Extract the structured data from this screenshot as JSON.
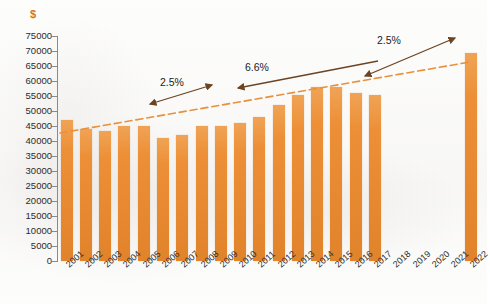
{
  "chart_data": {
    "type": "bar",
    "title": "",
    "subtitle": "",
    "xlabel": "",
    "ylabel": "$",
    "ylim": [
      0,
      75000
    ],
    "ytick_step": 5000,
    "grid": false,
    "legend": "none",
    "categories": [
      "2001",
      "2002",
      "2003",
      "2004",
      "2005",
      "2006",
      "2007",
      "2008",
      "2009",
      "2010",
      "2011",
      "2012",
      "2013",
      "2014",
      "2015",
      "2016",
      "2017",
      "2018",
      "2019",
      "2020",
      "2021",
      "2022"
    ],
    "values": [
      47000,
      44000,
      43500,
      45000,
      45000,
      41000,
      42000,
      45000,
      45000,
      46000,
      48000,
      52000,
      55500,
      58000,
      58000,
      56000,
      55500,
      null,
      null,
      null,
      null,
      69500
    ],
    "ytick_labels": [
      "75000",
      "70000",
      "65000",
      "60000",
      "55000",
      "50000",
      "45000",
      "40000",
      "35000",
      "30000",
      "25000",
      "20000",
      "15000",
      "10000",
      "5000",
      "0"
    ],
    "annotations": [
      {
        "text": "2.5%",
        "note": "growth rate annotation over 2001-2007 segment"
      },
      {
        "text": "6.6%",
        "note": "growth rate annotation over 2008-2017 segment"
      },
      {
        "text": "2.5%",
        "note": "growth rate annotation over 2017-2022 segment"
      }
    ],
    "trendline": {
      "style": "dashed",
      "color": "#e8903c",
      "from_year": "2001",
      "to_year": "2022"
    },
    "series_color": "#e8903c"
  },
  "axis": {
    "y_title": "$"
  },
  "annotations": {
    "first_rate": "2.5%",
    "second_rate": "6.6%",
    "third_rate": "2.5%"
  },
  "colors": {
    "bar": "#e8903c",
    "trendline": "#e8903c",
    "arrow": "#6b4423",
    "axis_title": "#d2762a"
  }
}
